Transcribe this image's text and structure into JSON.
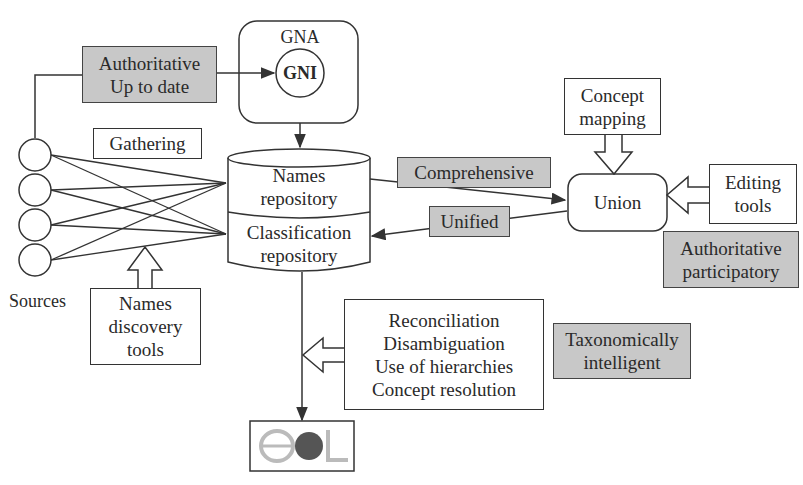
{
  "diagram": {
    "gna": {
      "title": "GNA",
      "gni": "GNI"
    },
    "authoritative_up_to_date": "Authoritative\nUp to date",
    "gathering": "Gathering",
    "sources": {
      "label": "Sources",
      "count": 4
    },
    "cylinder": {
      "top": "Names\nrepository",
      "bottom": "Classification\nrepository"
    },
    "names_discovery_tools": "Names\ndiscovery\ntools",
    "comprehensive": "Comprehensive",
    "unified": "Unified",
    "union": "Union",
    "concept_mapping": "Concept\nmapping",
    "editing_tools": "Editing\ntools",
    "authoritative_participatory": "Authoritative\nparticipatory",
    "services": "Reconciliation\nDisambiguation\nUse of hierarchies\nConcept resolution",
    "taxonomically_intelligent": "Taxonomically\nintelligent",
    "eol_logo": "eOL"
  },
  "colors": {
    "highlight_fill": "#c8c8c8",
    "stroke": "#333333"
  }
}
